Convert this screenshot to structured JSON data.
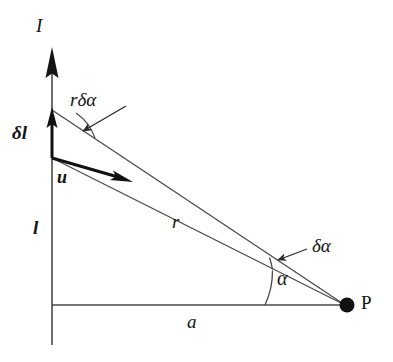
{
  "figure": {
    "background_color": "#ffffff",
    "stroke_color": "#3a3a3a",
    "bold_stroke_color": "#141414",
    "width": 393,
    "height": 362
  },
  "labels": {
    "current": "I",
    "arc_length": "rδα",
    "delta_l": "δl",
    "unit_vector": "u",
    "length_l": "l",
    "distance_r": "r",
    "distance_a": "a",
    "angle_alpha": "α",
    "angle_delta_alpha": "δα",
    "point_p": "P"
  },
  "geometry": {
    "origin": {
      "x": 52,
      "y": 305
    },
    "point_p": {
      "x": 345,
      "y": 305
    },
    "axis_top": {
      "x": 52,
      "y": 48
    },
    "axis_bottom": {
      "x": 52,
      "y": 345
    },
    "element_base": {
      "x": 52,
      "y": 158
    },
    "element_top": {
      "x": 52,
      "y": 110
    },
    "u_tip": {
      "x": 130,
      "y": 182
    },
    "alpha_arc_radius": 80,
    "r_delta_alpha_arc_radius": 50
  }
}
